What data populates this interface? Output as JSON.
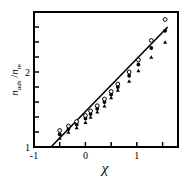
{
  "chart_data": {
    "type": "scatter",
    "title": "",
    "xlabel": "χ",
    "ylabel_main": "n",
    "ylabel_sub1": "ads",
    "ylabel_sep": " /",
    "ylabel_main2": "n",
    "ylabel_sub2": "m",
    "xlim": [
      -1,
      1.8
    ],
    "ylim": [
      1,
      2.8
    ],
    "x_ticks": [
      -1,
      -0.5,
      0,
      0.5,
      1,
      1.5
    ],
    "x_tick_labels": [
      "-1",
      "",
      "0",
      "",
      "1",
      ""
    ],
    "y_ticks": [
      1,
      1.2,
      1.4,
      1.6,
      1.8,
      2,
      2.2,
      2.4,
      2.6
    ],
    "y_tick_labels": [
      "1",
      "",
      "",
      "",
      "",
      "2",
      "",
      "",
      ""
    ],
    "grid": false,
    "legend": null,
    "series": [
      {
        "name": "data (open/filled markers)",
        "marker": "mixed circles and triangles",
        "points": [
          {
            "x": -0.5,
            "y": [
              1.12,
              1.17,
              1.22
            ]
          },
          {
            "x": -0.33,
            "y": [
              1.2,
              1.24,
              1.28
            ]
          },
          {
            "x": -0.17,
            "y": [
              1.26,
              1.3,
              1.34
            ]
          },
          {
            "x": 0.0,
            "y": [
              1.33,
              1.38,
              1.42
            ]
          },
          {
            "x": 0.1,
            "y": [
              1.4,
              1.44,
              1.48
            ]
          },
          {
            "x": 0.23,
            "y": [
              1.47,
              1.51,
              1.55
            ]
          },
          {
            "x": 0.37,
            "y": [
              1.55,
              1.6,
              1.64
            ]
          },
          {
            "x": 0.5,
            "y": [
              1.66,
              1.7,
              1.74
            ]
          },
          {
            "x": 0.63,
            "y": [
              1.76,
              1.8,
              1.84
            ]
          },
          {
            "x": 0.85,
            "y": [
              1.88,
              1.95,
              2.0
            ]
          },
          {
            "x": 1.03,
            "y": [
              2.02,
              2.1,
              2.16
            ]
          },
          {
            "x": 1.28,
            "y": [
              2.2,
              2.32,
              2.42
            ]
          },
          {
            "x": 1.55,
            "y": [
              2.4,
              2.55,
              2.7
            ]
          }
        ]
      },
      {
        "name": "fit line",
        "type": "line",
        "x": [
          -0.67,
          1.6
        ],
        "y": [
          1.0,
          2.6
        ]
      }
    ]
  }
}
